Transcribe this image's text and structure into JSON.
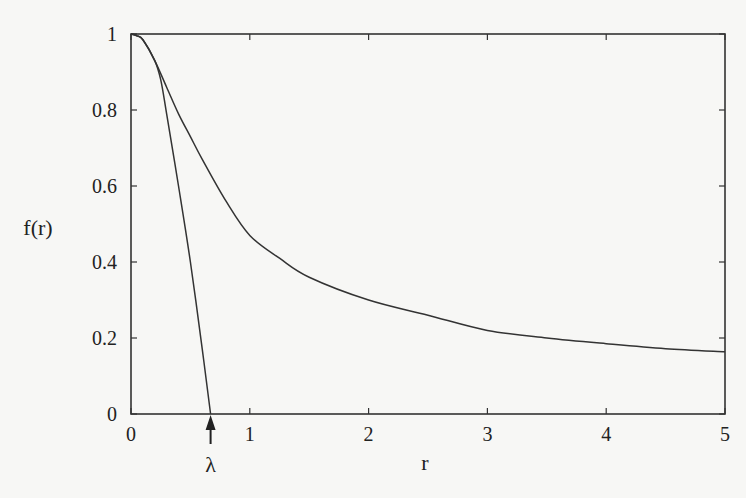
{
  "chart_data": {
    "type": "line",
    "title": "",
    "xlabel": "r",
    "ylabel": "f(r)",
    "xlim": [
      0,
      5
    ],
    "ylim": [
      0,
      1
    ],
    "grid": false,
    "legend": null,
    "x_ticks": [
      "0",
      "1",
      "2",
      "3",
      "4",
      "5"
    ],
    "y_ticks": [
      "0",
      "0.2",
      "0.4",
      "0.6",
      "0.8",
      "1"
    ],
    "series": [
      {
        "name": "slowly decaying curve",
        "x": [
          0,
          0.05,
          0.1,
          0.2,
          0.3,
          0.4,
          0.5,
          0.6,
          0.8,
          1.0,
          1.25,
          1.5,
          2.0,
          2.5,
          3.0,
          3.5,
          4.0,
          4.5,
          5.0
        ],
        "y": [
          1.0,
          0.995,
          0.985,
          0.93,
          0.86,
          0.79,
          0.73,
          0.67,
          0.56,
          0.47,
          0.41,
          0.36,
          0.3,
          0.26,
          0.22,
          0.2,
          0.185,
          0.172,
          0.164
        ]
      },
      {
        "name": "steep curve",
        "x": [
          0,
          0.05,
          0.1,
          0.2,
          0.25,
          0.3,
          0.4,
          0.5,
          0.6,
          0.67
        ],
        "y": [
          1.0,
          0.995,
          0.985,
          0.93,
          0.88,
          0.79,
          0.6,
          0.4,
          0.17,
          0.0
        ]
      }
    ],
    "annotations": [
      {
        "text": "λ",
        "x": 0.67,
        "y": 0,
        "type": "arrow-up",
        "description": "arrow marking where the steep curve reaches zero"
      }
    ]
  }
}
